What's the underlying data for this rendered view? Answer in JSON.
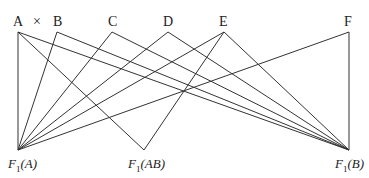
{
  "diagram": {
    "top_nodes": [
      {
        "id": "A",
        "label": "A",
        "x": 18,
        "y": 32
      },
      {
        "id": "B",
        "label": "B",
        "x": 57,
        "y": 32
      },
      {
        "id": "C",
        "label": "C",
        "x": 112,
        "y": 32
      },
      {
        "id": "D",
        "label": "D",
        "x": 168,
        "y": 32
      },
      {
        "id": "E",
        "label": "E",
        "x": 224,
        "y": 32
      },
      {
        "id": "F",
        "label": "F",
        "x": 349,
        "y": 32
      }
    ],
    "cross_symbol": "×",
    "bottom_nodes": [
      {
        "id": "F1A",
        "prefix": "F",
        "sub": "1",
        "arg": "(A)",
        "x": 18,
        "y": 150
      },
      {
        "id": "F1AB",
        "prefix": "F",
        "sub": "1",
        "arg": "(AB)",
        "x": 144,
        "y": 150
      },
      {
        "id": "F1B",
        "prefix": "F",
        "sub": "1",
        "arg": "(B)",
        "x": 349,
        "y": 150
      }
    ],
    "edges": [
      [
        "A",
        "F1A"
      ],
      [
        "A",
        "F1AB"
      ],
      [
        "A",
        "F1B"
      ],
      [
        "B",
        "F1A"
      ],
      [
        "B",
        "F1B"
      ],
      [
        "C",
        "F1A"
      ],
      [
        "C",
        "F1B"
      ],
      [
        "D",
        "F1A"
      ],
      [
        "D",
        "F1B"
      ],
      [
        "E",
        "F1A"
      ],
      [
        "E",
        "F1AB"
      ],
      [
        "E",
        "F1B"
      ],
      [
        "F",
        "F1A"
      ],
      [
        "F",
        "F1B"
      ]
    ]
  }
}
